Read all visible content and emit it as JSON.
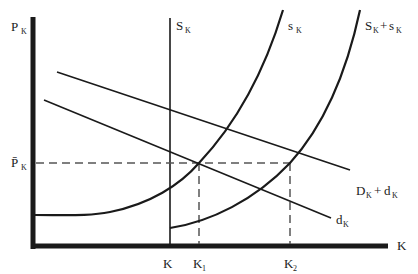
{
  "diagram": {
    "type": "supply-demand",
    "axes": {
      "y_label": "P",
      "y_label_sub": "K",
      "x_label": "K"
    },
    "price_level": {
      "label": "P̄",
      "label_sub": "K"
    },
    "curves": {
      "fixed_supply": {
        "label": "S",
        "label_sub": "K"
      },
      "new_supply": {
        "label": "s",
        "label_sub": "K"
      },
      "total_supply": {
        "label_a": "S",
        "label_a_sub": "K",
        "op": "+",
        "label_b": "s",
        "label_b_sub": "K"
      },
      "total_demand": {
        "label_a": "D",
        "label_a_sub": "K",
        "op": "+",
        "label_b": "d",
        "label_b_sub": "K"
      },
      "new_demand": {
        "label": "d",
        "label_sub": "K"
      }
    },
    "x_ticks": [
      {
        "label": "K",
        "sub": ""
      },
      {
        "label": "K",
        "sub": "1"
      },
      {
        "label": "K",
        "sub": "2"
      }
    ]
  },
  "colors": {
    "ink": "#1a1a1a",
    "dashed": "#555555",
    "background": "#ffffff"
  }
}
